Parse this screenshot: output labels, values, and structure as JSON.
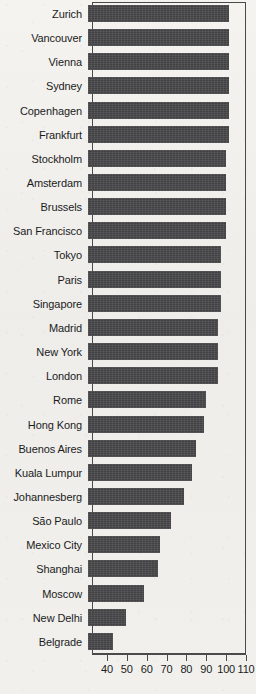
{
  "chart_data": {
    "type": "bar",
    "orientation": "horizontal",
    "title": "",
    "subtitle": "",
    "xlabel": "",
    "ylabel": "",
    "xlim": [
      32.5,
      110
    ],
    "xticks": [
      40,
      50,
      60,
      70,
      80,
      90,
      100,
      110
    ],
    "xtick_labels": [
      "40",
      "50",
      "60",
      "70",
      "80",
      "90",
      "100",
      "110"
    ],
    "grid": false,
    "legend": false,
    "bar_color": "#49494b",
    "axis_color": "#4a4a4a",
    "categories": [
      "Zurich",
      "Vancouver",
      "Vienna",
      "Sydney",
      "Copenhagen",
      "Frankfurt",
      "Stockholm",
      "Amsterdam",
      "Brussels",
      "San Francisco",
      "Tokyo",
      "Paris",
      "Singapore",
      "Madrid",
      "New York",
      "London",
      "Rome",
      "Hong Kong",
      "Buenos Aires",
      "Kuala Lumpur",
      "Johannesberg",
      "São Paulo",
      "Mexico City",
      "Shanghai",
      "Moscow",
      "New Delhi",
      "Belgrade"
    ],
    "values": [
      103.5,
      103.5,
      103.5,
      103.5,
      103.5,
      103.5,
      102,
      102,
      102,
      102,
      99.5,
      99.5,
      99.5,
      98,
      98,
      98,
      92,
      91,
      87,
      85,
      81,
      74.5,
      68.5,
      67.5,
      60.5,
      51.5,
      45
    ]
  }
}
